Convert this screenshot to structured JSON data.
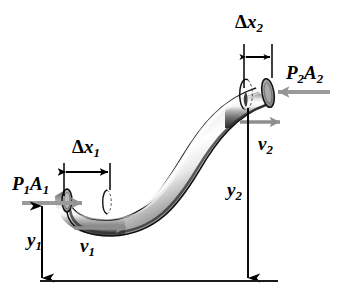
{
  "figure": {
    "width": 350,
    "height": 307,
    "background_color": "#ffffff"
  },
  "colors": {
    "ink": "#000000",
    "force_arrow": "#9a9a9a",
    "velocity_arrow": "#8e8e8e",
    "pipe_dark": "#3a3a3a",
    "pipe_mid": "#8c8c8c",
    "pipe_highlight": "#ffffff",
    "baseline": "#1a1a1a"
  },
  "labels": {
    "pressure_force_1": {
      "base": "P",
      "sub1": "1",
      "base2": "A",
      "sub2": "1",
      "text": "P1A1"
    },
    "pressure_force_2": {
      "base": "P",
      "sub1": "2",
      "base2": "A",
      "sub2": "2",
      "text": "P2A2"
    },
    "displacement_1": {
      "delta": "Δ",
      "base": "x",
      "sub": "1",
      "text": "Δx1"
    },
    "displacement_2": {
      "delta": "Δ",
      "base": "x",
      "sub": "2",
      "text": "Δx2"
    },
    "velocity_1": {
      "base": "v",
      "sub": "1",
      "text": "v1"
    },
    "velocity_2": {
      "base": "v",
      "sub": "2",
      "text": "v2"
    },
    "height_1": {
      "base": "y",
      "sub": "1",
      "text": "y1"
    },
    "height_2": {
      "base": "y",
      "sub": "2",
      "text": "y2"
    }
  },
  "annotations": {
    "baseline_name": "ground-reference-line",
    "inlet_name": "pipe-inlet-opening",
    "outlet_name": "pipe-outlet-opening",
    "slug_boundary_1": "inlet-fluid-slug-boundary",
    "slug_boundary_2": "outlet-fluid-slug-boundary"
  }
}
